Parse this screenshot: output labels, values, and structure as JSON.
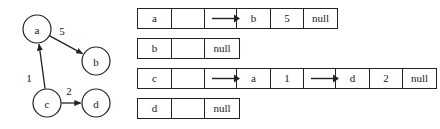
{
  "graph": {
    "nodes": [
      {
        "id": "a",
        "label": "a",
        "cx": 37,
        "cy": 29,
        "r": 14
      },
      {
        "id": "b",
        "label": "b",
        "cx": 96,
        "cy": 61,
        "r": 14
      },
      {
        "id": "c",
        "label": "c",
        "cx": 47,
        "cy": 103,
        "r": 14
      },
      {
        "id": "d",
        "label": "d",
        "cx": 96,
        "cy": 103,
        "r": 14
      }
    ],
    "edges": [
      {
        "from": "a",
        "to": "b",
        "weight": "5",
        "label_x": 62,
        "label_y": 31
      },
      {
        "from": "c",
        "to": "a",
        "weight": "1",
        "label_x": 29,
        "label_y": 78
      },
      {
        "from": "c",
        "to": "d",
        "weight": "2",
        "label_x": 69,
        "label_y": 91
      }
    ]
  },
  "adjacency_list": {
    "null_label": "null",
    "rows": [
      {
        "key": "a",
        "top": 8,
        "boxes": [
          {
            "left": 7,
            "cells": [
              "a",
              "",
              ""
            ],
            "trailing_pointer": true
          },
          {
            "left": 106,
            "cells": [
              "b",
              "5",
              "null"
            ],
            "trailing_pointer": false
          }
        ],
        "connectors": [
          {
            "x": 82,
            "width": 28
          }
        ]
      },
      {
        "key": "b",
        "top": 38,
        "boxes": [
          {
            "left": 7,
            "cells": [
              "b",
              "",
              "null"
            ],
            "trailing_pointer": false
          }
        ],
        "connectors": []
      },
      {
        "key": "c",
        "top": 68,
        "boxes": [
          {
            "left": 7,
            "cells": [
              "c",
              "",
              ""
            ],
            "trailing_pointer": true
          },
          {
            "left": 106,
            "cells": [
              "a",
              "1",
              ""
            ],
            "trailing_pointer": true
          },
          {
            "left": 205,
            "cells": [
              "d",
              "2",
              "null"
            ],
            "trailing_pointer": false
          }
        ],
        "connectors": [
          {
            "x": 82,
            "width": 28
          },
          {
            "x": 181,
            "width": 28
          }
        ]
      },
      {
        "key": "d",
        "top": 98,
        "boxes": [
          {
            "left": 7,
            "cells": [
              "d",
              "",
              "null"
            ],
            "trailing_pointer": false
          }
        ],
        "connectors": []
      }
    ]
  },
  "style": {
    "stroke": "#222222",
    "text": "#1a1a1a",
    "background": "#ffffff"
  }
}
